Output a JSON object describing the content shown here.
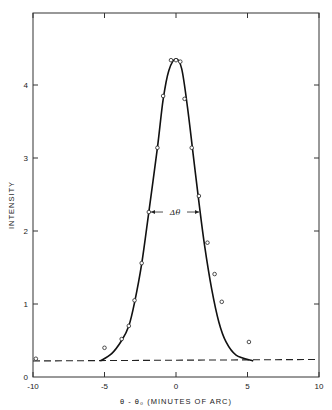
{
  "chart_data": {
    "type": "line",
    "title": "",
    "xlabel": "θ - θ₀  (MINUTES OF ARC)",
    "ylabel": "INTENSITY",
    "xlim": [
      -10,
      10
    ],
    "ylim": [
      0,
      4.75
    ],
    "x_ticks": [
      -10,
      -5,
      0,
      5,
      10
    ],
    "x_tick_labels": [
      "-10",
      "-5",
      "0",
      "5",
      "10"
    ],
    "y_ticks": [
      0,
      1,
      2,
      3,
      4
    ],
    "y_tick_labels": [
      "0",
      "1",
      "2",
      "3",
      "4"
    ],
    "grid": false,
    "legend": null,
    "series": [
      {
        "name": "measured points",
        "style": "open circles",
        "x": [
          -9.8,
          -5.0,
          -3.8,
          -3.3,
          -2.9,
          -2.4,
          -1.9,
          -1.3,
          -0.9,
          -0.35,
          0.0,
          0.3,
          0.6,
          1.1,
          1.6,
          2.2,
          2.7,
          3.2,
          5.1
        ],
        "y": [
          0.25,
          0.4,
          0.52,
          0.7,
          1.05,
          1.56,
          2.26,
          3.14,
          3.85,
          4.34,
          4.34,
          4.32,
          3.81,
          3.14,
          2.48,
          1.84,
          1.41,
          1.03,
          0.48
        ]
      },
      {
        "name": "fitted curve",
        "style": "solid line",
        "x": [
          -5.3,
          -4.5,
          -3.8,
          -3.3,
          -2.9,
          -2.4,
          -1.9,
          -1.3,
          -0.9,
          -0.5,
          0.0,
          0.4,
          0.8,
          1.2,
          1.6,
          2.0,
          2.5,
          3.0,
          3.5,
          4.2,
          5.4
        ],
        "y": [
          0.22,
          0.32,
          0.5,
          0.7,
          1.02,
          1.55,
          2.26,
          3.14,
          3.8,
          4.2,
          4.36,
          4.22,
          3.7,
          3.05,
          2.4,
          1.8,
          1.2,
          0.75,
          0.48,
          0.3,
          0.22
        ]
      },
      {
        "name": "background level",
        "style": "dashed line",
        "x": [
          -10,
          10
        ],
        "y": [
          0.22,
          0.24
        ]
      }
    ],
    "annotations": [
      {
        "text": "Δθ",
        "x": 0,
        "y": 2.26,
        "description": "full width arrow between curve flanks at half maximum"
      }
    ]
  }
}
